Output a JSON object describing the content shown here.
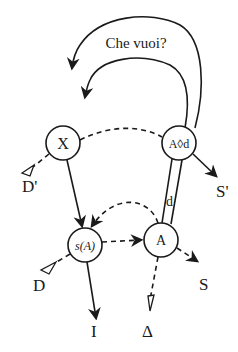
{
  "diagram": {
    "question_label": "Che vuoi?",
    "nodes": {
      "x": "X",
      "a_lozenge_d": "A◊d",
      "s_of_a": "s(A)",
      "a": "A"
    },
    "labels": {
      "d_prime": "D'",
      "s_prime": "S'",
      "d": "D",
      "s": "S",
      "i": "I",
      "delta": "Δ",
      "d_small": "d"
    }
  }
}
